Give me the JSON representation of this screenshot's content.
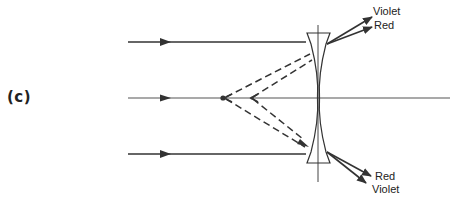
{
  "panel_label": "(c)",
  "diagram": {
    "colors": {
      "stroke": "#333333",
      "background": "#ffffff"
    },
    "labels": {
      "top_violet": "Violet",
      "top_red": "Red",
      "bottom_red": "Red",
      "bottom_violet": "Violet"
    },
    "elements": [
      "incoming-ray-top",
      "optical-axis",
      "incoming-ray-bottom",
      "concave-lens",
      "virtual-focus-violet",
      "virtual-focus-red",
      "dashed-extension-lines",
      "diverging-violet-ray-top",
      "diverging-red-ray-top",
      "diverging-red-ray-bottom",
      "diverging-violet-ray-bottom"
    ]
  }
}
